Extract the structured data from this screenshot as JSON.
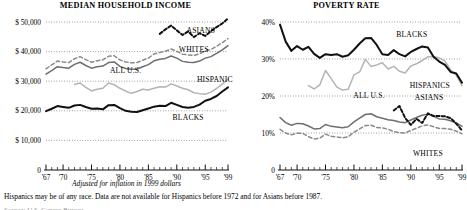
{
  "figure": {
    "caption_axis": "Adjusted for inflation in 1999 dollars",
    "footnote": "Hispanics may be of any race. Data are not available for Hispanics before 1972 and for Asians before 1987.",
    "source_partial": "Source: U.S. Census Bureau"
  },
  "colors": {
    "blacks": "#111111",
    "asians": "#111111",
    "all_us": "#6e6e6e",
    "whites": "#8a8a8a",
    "hispanics": "#b4b4b4",
    "gridline": "#555555",
    "axis": "#111111",
    "background": "#ffffff"
  },
  "chart_data": [
    {
      "type": "line",
      "id": "median-household-income",
      "title": "MEDIAN HOUSEHOLD INCOME",
      "xlabel": "Adjusted for inflation in 1999 dollars",
      "ylabel": "",
      "xlim": [
        1967,
        1999
      ],
      "ylim": [
        0,
        50000
      ],
      "grid": true,
      "legend_position": "inline-annotations",
      "ytick_values": [
        50000,
        40000,
        30000,
        20000,
        10000,
        0
      ],
      "ytick_labels": [
        "$ 50,000",
        "$ 40,000",
        "$ 30,000",
        "$ 20,000",
        "$ 10,000",
        "0"
      ],
      "xtick_values": [
        1967,
        1970,
        1975,
        1980,
        1985,
        1990,
        1995,
        1999
      ],
      "xtick_labels": [
        "'67",
        "'70",
        "'75",
        "'80",
        "'85",
        "'90",
        "'95",
        "'99"
      ],
      "x": [
        1967,
        1968,
        1969,
        1970,
        1971,
        1972,
        1973,
        1974,
        1975,
        1976,
        1977,
        1978,
        1979,
        1980,
        1981,
        1982,
        1983,
        1984,
        1985,
        1986,
        1987,
        1988,
        1989,
        1990,
        1991,
        1992,
        1993,
        1994,
        1995,
        1996,
        1997,
        1998,
        1999
      ],
      "series": [
        {
          "name": "ASIANS",
          "style": "bold-dashed",
          "color": "#111111",
          "x": [
            1987,
            1988,
            1989,
            1990,
            1991,
            1992,
            1993,
            1994,
            1995,
            1996,
            1997,
            1998,
            1999
          ],
          "values": [
            46000,
            47500,
            48800,
            47200,
            45600,
            46800,
            44900,
            46200,
            45300,
            46900,
            48300,
            49500,
            51200
          ]
        },
        {
          "name": "WHITES",
          "style": "dashed",
          "color": "#8a8a8a",
          "x": [
            1967,
            1968,
            1969,
            1970,
            1971,
            1972,
            1973,
            1974,
            1975,
            1976,
            1977,
            1978,
            1979,
            1980,
            1981,
            1982,
            1983,
            1984,
            1985,
            1986,
            1987,
            1988,
            1989,
            1990,
            1991,
            1992,
            1993,
            1994,
            1995,
            1996,
            1997,
            1998,
            1999
          ],
          "values": [
            34200,
            35500,
            36800,
            36500,
            36300,
            37600,
            38300,
            37300,
            36400,
            36900,
            37200,
            38400,
            38600,
            37200,
            36500,
            36200,
            36300,
            37100,
            37800,
            39200,
            39700,
            40100,
            40900,
            40100,
            39100,
            38900,
            38700,
            39300,
            40200,
            40700,
            41800,
            43000,
            44400
          ]
        },
        {
          "name": "ALL U.S.",
          "style": "solid",
          "color": "#6e6e6e",
          "x": [
            1967,
            1968,
            1969,
            1970,
            1971,
            1972,
            1973,
            1974,
            1975,
            1976,
            1977,
            1978,
            1979,
            1980,
            1981,
            1982,
            1983,
            1984,
            1985,
            1986,
            1987,
            1988,
            1989,
            1990,
            1991,
            1992,
            1993,
            1994,
            1995,
            1996,
            1997,
            1998,
            1999
          ],
          "values": [
            32400,
            33600,
            34900,
            34600,
            34400,
            35700,
            36400,
            35300,
            34400,
            34900,
            35100,
            36300,
            36500,
            35000,
            34300,
            34000,
            34100,
            34900,
            35600,
            36900,
            37400,
            37700,
            38500,
            37800,
            36700,
            36400,
            36300,
            36800,
            37800,
            38300,
            39400,
            40600,
            42000
          ]
        },
        {
          "name": "HISPANICS",
          "style": "solid",
          "color": "#b4b4b4",
          "x": [
            1972,
            1973,
            1974,
            1975,
            1976,
            1977,
            1978,
            1979,
            1980,
            1981,
            1982,
            1983,
            1984,
            1985,
            1986,
            1987,
            1988,
            1989,
            1990,
            1991,
            1992,
            1993,
            1994,
            1995,
            1996,
            1997,
            1998,
            1999
          ],
          "values": [
            28900,
            29400,
            27900,
            26700,
            27300,
            27600,
            29400,
            28800,
            27600,
            26700,
            25900,
            26500,
            27300,
            27000,
            27600,
            28100,
            28000,
            29100,
            28400,
            27600,
            27100,
            26100,
            25800,
            25600,
            26300,
            27600,
            29000,
            30700
          ]
        },
        {
          "name": "BLACKS",
          "style": "bold-solid",
          "color": "#111111",
          "x": [
            1967,
            1968,
            1969,
            1970,
            1971,
            1972,
            1973,
            1974,
            1975,
            1976,
            1977,
            1978,
            1979,
            1980,
            1981,
            1982,
            1983,
            1984,
            1985,
            1986,
            1987,
            1988,
            1989,
            1990,
            1991,
            1992,
            1993,
            1994,
            1995,
            1996,
            1997,
            1998,
            1999
          ],
          "values": [
            19900,
            20700,
            21600,
            21300,
            21000,
            21800,
            22000,
            21300,
            20700,
            20800,
            20500,
            21900,
            22000,
            20900,
            20000,
            19700,
            19600,
            20200,
            20800,
            21400,
            21700,
            21600,
            22700,
            22000,
            21300,
            21000,
            21300,
            22100,
            23400,
            24000,
            25000,
            26500,
            27900
          ]
        }
      ],
      "annotations": [
        {
          "text": "ASIANS",
          "near_year": 1991,
          "near_value": 46000
        },
        {
          "text": "WHITES",
          "near_year": 1990,
          "near_value": 40500
        },
        {
          "text": "ALL U.S.",
          "near_year": 1981,
          "near_value": 31500
        },
        {
          "text": "HISPANICS",
          "near_year": 1993,
          "near_value": 30000
        },
        {
          "text": "BLACKS",
          "near_year": 1992,
          "near_value": 19800
        }
      ]
    },
    {
      "type": "line",
      "id": "poverty-rate",
      "title": "POVERTY RATE",
      "xlabel": "",
      "ylabel": "",
      "xlim": [
        1967,
        1999
      ],
      "ylim": [
        0,
        40
      ],
      "grid": true,
      "legend_position": "inline-annotations",
      "ytick_values": [
        40,
        30,
        20,
        10,
        0
      ],
      "ytick_labels": [
        "40%",
        "30%",
        "20%",
        "10%",
        "0"
      ],
      "xtick_values": [
        1967,
        1970,
        1975,
        1980,
        1985,
        1990,
        1995,
        1999
      ],
      "xtick_labels": [
        "'67",
        "'70",
        "'75",
        "'80",
        "'85",
        "'90",
        "'95",
        "'99"
      ],
      "x": [
        1967,
        1968,
        1969,
        1970,
        1971,
        1972,
        1973,
        1974,
        1975,
        1976,
        1977,
        1978,
        1979,
        1980,
        1981,
        1982,
        1983,
        1984,
        1985,
        1986,
        1987,
        1988,
        1989,
        1990,
        1991,
        1992,
        1993,
        1994,
        1995,
        1996,
        1997,
        1998,
        1999
      ],
      "series": [
        {
          "name": "BLACKS",
          "style": "bold-solid",
          "color": "#111111",
          "x": [
            1967,
            1968,
            1969,
            1970,
            1971,
            1972,
            1973,
            1974,
            1975,
            1976,
            1977,
            1978,
            1979,
            1980,
            1981,
            1982,
            1983,
            1984,
            1985,
            1986,
            1987,
            1988,
            1989,
            1990,
            1991,
            1992,
            1993,
            1994,
            1995,
            1996,
            1997,
            1998,
            1999
          ],
          "values": [
            39.3,
            34.7,
            32.2,
            33.5,
            32.5,
            33.3,
            31.4,
            30.3,
            31.3,
            31.1,
            31.3,
            30.6,
            31.0,
            32.5,
            34.2,
            35.6,
            35.7,
            33.8,
            31.3,
            31.1,
            32.4,
            31.3,
            30.7,
            31.9,
            32.7,
            33.4,
            33.1,
            30.6,
            29.3,
            28.4,
            26.5,
            26.1,
            23.6
          ]
        },
        {
          "name": "HISPANICS",
          "style": "solid",
          "color": "#b4b4b4",
          "x": [
            1972,
            1973,
            1974,
            1975,
            1976,
            1977,
            1978,
            1979,
            1980,
            1981,
            1982,
            1983,
            1984,
            1985,
            1986,
            1987,
            1988,
            1989,
            1990,
            1991,
            1992,
            1993,
            1994,
            1995,
            1996,
            1997,
            1998,
            1999
          ],
          "values": [
            22.8,
            21.9,
            23.0,
            26.9,
            24.7,
            22.4,
            21.6,
            21.8,
            25.7,
            26.5,
            29.9,
            28.0,
            28.4,
            29.0,
            27.3,
            28.0,
            26.7,
            26.2,
            28.1,
            28.7,
            29.6,
            30.6,
            30.7,
            30.3,
            29.4,
            27.1,
            25.6,
            22.8
          ]
        },
        {
          "name": "ALL U.S.",
          "style": "solid",
          "color": "#6e6e6e",
          "x": [
            1967,
            1968,
            1969,
            1970,
            1971,
            1972,
            1973,
            1974,
            1975,
            1976,
            1977,
            1978,
            1979,
            1980,
            1981,
            1982,
            1983,
            1984,
            1985,
            1986,
            1987,
            1988,
            1989,
            1990,
            1991,
            1992,
            1993,
            1994,
            1995,
            1996,
            1997,
            1998,
            1999
          ],
          "values": [
            14.2,
            12.8,
            12.1,
            12.6,
            12.5,
            11.9,
            11.1,
            11.2,
            12.3,
            11.8,
            11.6,
            11.4,
            11.7,
            13.0,
            14.0,
            15.0,
            15.2,
            14.4,
            14.0,
            13.6,
            13.4,
            13.0,
            12.8,
            13.5,
            14.2,
            14.8,
            15.1,
            14.5,
            13.8,
            13.7,
            13.3,
            12.7,
            11.8
          ]
        },
        {
          "name": "ASIANS",
          "style": "bold-dashed",
          "color": "#111111",
          "x": [
            1987,
            1988,
            1989,
            1990,
            1991,
            1992,
            1993,
            1994,
            1995,
            1996,
            1997,
            1998,
            1999
          ],
          "values": [
            16.1,
            17.3,
            14.1,
            12.2,
            13.8,
            12.7,
            15.3,
            14.6,
            14.6,
            14.5,
            14.0,
            12.5,
            10.7
          ]
        },
        {
          "name": "WHITES",
          "style": "dashed",
          "color": "#8a8a8a",
          "x": [
            1967,
            1968,
            1969,
            1970,
            1971,
            1972,
            1973,
            1974,
            1975,
            1976,
            1977,
            1978,
            1979,
            1980,
            1981,
            1982,
            1983,
            1984,
            1985,
            1986,
            1987,
            1988,
            1989,
            1990,
            1991,
            1992,
            1993,
            1994,
            1995,
            1996,
            1997,
            1998,
            1999
          ],
          "values": [
            11.0,
            10.0,
            9.5,
            9.9,
            9.9,
            9.0,
            8.4,
            8.6,
            9.7,
            9.1,
            8.9,
            8.7,
            9.0,
            10.2,
            11.1,
            12.0,
            12.1,
            11.5,
            11.4,
            11.0,
            10.4,
            10.1,
            10.0,
            10.7,
            11.3,
            11.9,
            12.2,
            11.7,
            11.2,
            11.2,
            11.0,
            10.5,
            9.8
          ]
        }
      ],
      "annotations": [
        {
          "text": "BLACKS",
          "near_year": 1990,
          "near_value": 34.5
        },
        {
          "text": "HISPANICS",
          "near_year": 1993,
          "near_value": 24.5
        },
        {
          "text": "ALL U.S.",
          "near_year": 1983,
          "near_value": 18.0
        },
        {
          "text": "ASIANS",
          "near_year": 1990,
          "near_value": 18.5
        },
        {
          "text": "WHITES",
          "near_year": 1993,
          "near_value": 7.0
        }
      ]
    }
  ]
}
